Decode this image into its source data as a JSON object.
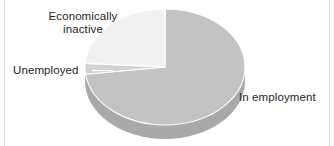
{
  "chart_data": {
    "type": "pie",
    "title": "",
    "subtitle": "",
    "xlabel": "",
    "ylabel": "",
    "legend_position": "callout-labels",
    "grid": false,
    "three_d": true,
    "categories": [
      "In employment",
      "Economically inactive",
      "Unemployed"
    ],
    "values": [
      73,
      24,
      3
    ],
    "slices": [
      {
        "label": "In employment",
        "value": 73,
        "color": "#c3c3c3",
        "start_angle_deg": 0,
        "end_angle_deg": 262.8
      },
      {
        "label": "Economically inactive",
        "value": 24,
        "color": "#f1f1f1",
        "start_angle_deg": 273.6,
        "end_angle_deg": 360
      },
      {
        "label": "Unemployed",
        "value": 3,
        "color": "#d2d2d2",
        "start_angle_deg": 262.8,
        "end_angle_deg": 273.6
      }
    ]
  },
  "labels": {
    "economically_inactive": "Economically\ninactive",
    "unemployed": "Unemployed",
    "in_employment": "In employment"
  },
  "colors": {
    "background": "#ffffff",
    "slice_in_employment": "#c3c3c3",
    "slice_economically_inactive": "#f1f1f1",
    "slice_unemployed": "#d2d2d2",
    "side_wall_in_employment": "#a9a9a9",
    "side_wall_economically_inactive": "#cfcfcf",
    "slice_outline": "#ffffff",
    "text": "#231f20",
    "edge_rule": "#d9d9d9"
  }
}
